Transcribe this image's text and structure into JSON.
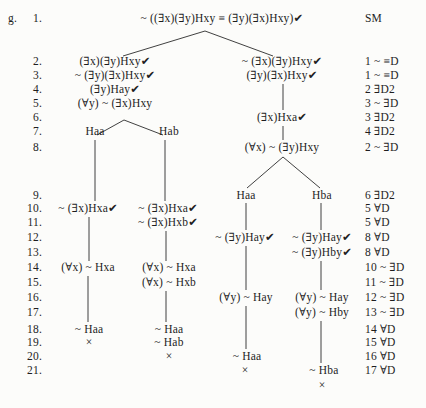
{
  "labels": {
    "exercise": "g."
  },
  "rows": [
    {
      "line": "1.",
      "justification": "SM"
    },
    {
      "line": "2.",
      "justification": "1 ~ ≡D"
    },
    {
      "line": "3.",
      "justification": "1 ~ ≡D"
    },
    {
      "line": "4.",
      "justification": "2 ∃D2"
    },
    {
      "line": "5.",
      "justification": "3 ~ ∃D"
    },
    {
      "line": "6.",
      "justification": "3 ∃D2"
    },
    {
      "line": "7.",
      "justification": "4 ∃D2"
    },
    {
      "line": "8.",
      "justification": "2 ~ ∃D"
    },
    {
      "line": "9.",
      "justification": "6 ∃D2"
    },
    {
      "line": "10.",
      "justification": "5 ∀D"
    },
    {
      "line": "11.",
      "justification": "5 ∀D"
    },
    {
      "line": "12.",
      "justification": "8 ∀D"
    },
    {
      "line": "13.",
      "justification": "8 ∀D"
    },
    {
      "line": "14.",
      "justification": "10 ~ ∃D"
    },
    {
      "line": "15.",
      "justification": "11 ~ ∃D"
    },
    {
      "line": "16.",
      "justification": "12 ~ ∃D"
    },
    {
      "line": "17.",
      "justification": "13 ~ ∃D"
    },
    {
      "line": "18.",
      "justification": "14 ∀D"
    },
    {
      "line": "19.",
      "justification": "15 ∀D"
    },
    {
      "line": "20.",
      "justification": "16 ∀D"
    },
    {
      "line": "21.",
      "justification": "17 ∀D"
    }
  ],
  "nodes": [
    {
      "text": "~ ((∃x)(∃y)Hxy ≡ (∃y)(∃x)Hxy)✔"
    },
    {
      "text": "(∃x)(∃y)Hxy✔"
    },
    {
      "text": "~ (∃x)(∃y)Hxy✔"
    },
    {
      "text": "~ (∃y)(∃x)Hxy✔"
    },
    {
      "text": "(∃y)(∃x)Hxy✔"
    },
    {
      "text": "(∃y)Hay✔"
    },
    {
      "text": "(∀y) ~ (∃x)Hxy"
    },
    {
      "text": "(∃x)Hxa✔"
    },
    {
      "text": "Haa"
    },
    {
      "text": "Hab"
    },
    {
      "text": "(∀x) ~ (∃y)Hxy"
    },
    {
      "text": "Haa"
    },
    {
      "text": "Hba"
    },
    {
      "text": "~ (∃x)Hxa✔"
    },
    {
      "text": "~ (∃x)Hxa✔"
    },
    {
      "text": "~ (∃x)Hxb✔"
    },
    {
      "text": "~ (∃y)Hay✔"
    },
    {
      "text": "~ (∃y)Hay✔"
    },
    {
      "text": "~ (∃y)Hby✔"
    },
    {
      "text": "(∀x) ~ Hxa"
    },
    {
      "text": "(∀x) ~ Hxa"
    },
    {
      "text": "(∀x) ~ Hxb"
    },
    {
      "text": "(∀y) ~ Hay"
    },
    {
      "text": "(∀y) ~ Hay"
    },
    {
      "text": "(∀y) ~ Hby"
    },
    {
      "text": "~ Haa"
    },
    {
      "text": "~ Haa"
    },
    {
      "text": "×"
    },
    {
      "text": "~ Hab"
    },
    {
      "text": "×"
    },
    {
      "text": "~ Haa"
    },
    {
      "text": "×"
    },
    {
      "text": "~ Hba"
    },
    {
      "text": "×"
    }
  ]
}
